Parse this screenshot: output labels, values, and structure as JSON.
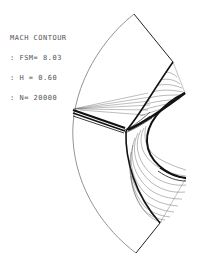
{
  "legend": {
    "title": "MACH CONTOUR",
    "lines": [
      ": FSM= 8.03",
      ": H = 0.60",
      ": N= 20000"
    ]
  },
  "colors": {
    "background": "#ffffff",
    "boundary": "#222222",
    "contour": "#333333",
    "text": "#555555"
  }
}
